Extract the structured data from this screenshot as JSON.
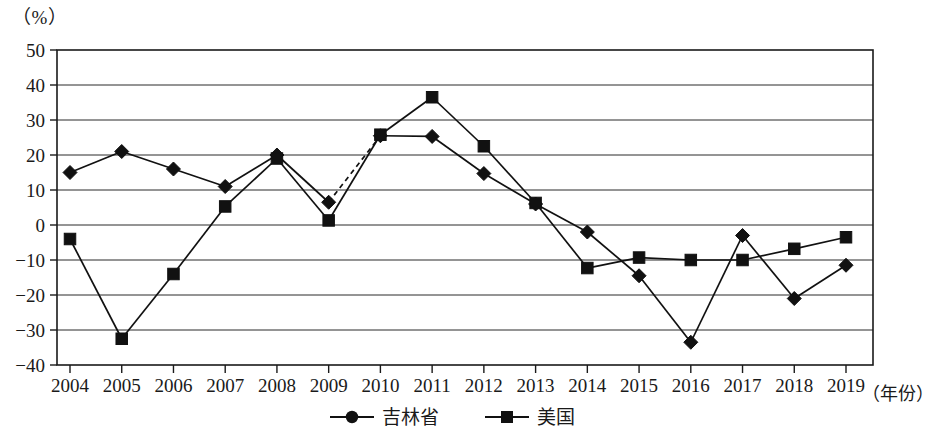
{
  "chart_data": {
    "type": "line",
    "title": "",
    "subtitle": "",
    "unit_label": "（%）",
    "xlabel": "（年份）",
    "ylabel": "",
    "grid": true,
    "legend_position": "bottom",
    "ylim": [
      -40,
      50
    ],
    "ytick_step": 10,
    "yticks": [
      "50",
      "40",
      "30",
      "20",
      "10",
      "0",
      "−10",
      "−20",
      "−30",
      "−40"
    ],
    "ytick_values": [
      50,
      40,
      30,
      20,
      10,
      0,
      -10,
      -20,
      -30,
      -40
    ],
    "categories": [
      "2004",
      "2005",
      "2006",
      "2007",
      "2008",
      "2009",
      "2010",
      "2011",
      "2012",
      "2013",
      "2014",
      "2015",
      "2016",
      "2017",
      "2018",
      "2019"
    ],
    "x": [
      2004,
      2005,
      2006,
      2007,
      2008,
      2009,
      2010,
      2011,
      2012,
      2013,
      2014,
      2015,
      2016,
      2017,
      2018,
      2019
    ],
    "series": [
      {
        "name": "吉林省",
        "marker": "diamond",
        "values": [
          15,
          21,
          16,
          11,
          20,
          6.5,
          25.5,
          25.3,
          14.7,
          6,
          -2,
          -14.5,
          -33.5,
          -3,
          -21,
          -11.5
        ],
        "dashed_segments": [
          [
            2009,
            2010
          ]
        ]
      },
      {
        "name": "美国",
        "marker": "square",
        "values": [
          -4,
          -32.5,
          -14,
          5.3,
          19,
          1.3,
          25.8,
          36.5,
          22.5,
          6.3,
          -12.3,
          -9.3,
          -10,
          -10,
          -6.8,
          -3.5
        ],
        "dashed_segments": []
      }
    ],
    "legend": [
      {
        "label": "吉林省",
        "marker": "diamond",
        "color": "#111111"
      },
      {
        "label": "美国",
        "marker": "square",
        "color": "#111111"
      }
    ],
    "colors": {
      "line": "#111111",
      "grid": "#2b2b2b",
      "frame": "#1a1a1a",
      "background": "#ffffff"
    }
  }
}
